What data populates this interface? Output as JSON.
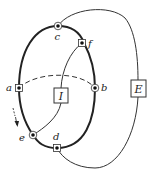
{
  "diagram": {
    "vertices": {
      "a": {
        "label": "a",
        "marker": "square"
      },
      "b": {
        "label": "b",
        "marker": "circle"
      },
      "c": {
        "label": "c",
        "marker": "circle"
      },
      "d": {
        "label": "d",
        "marker": "square"
      },
      "e": {
        "label": "e",
        "marker": "circle"
      },
      "f": {
        "label": "f",
        "marker": "square"
      }
    },
    "boxes": {
      "inner": {
        "label": "I"
      },
      "outer": {
        "label": "E"
      }
    },
    "edges": [
      {
        "from": "a",
        "to": "c",
        "style": "thick"
      },
      {
        "from": "c",
        "to": "f",
        "style": "thick"
      },
      {
        "from": "f",
        "to": "b",
        "style": "thick"
      },
      {
        "from": "b",
        "to": "d",
        "style": "thick"
      },
      {
        "from": "d",
        "to": "e",
        "style": "thick"
      },
      {
        "from": "e",
        "to": "a",
        "style": "thick"
      },
      {
        "from": "a",
        "to": "b",
        "style": "dashed"
      },
      {
        "from": "f",
        "to": "I",
        "style": "thin"
      },
      {
        "from": "I",
        "to": "e",
        "style": "thin"
      },
      {
        "from": "c",
        "to": "E",
        "style": "thin"
      },
      {
        "from": "E",
        "to": "d",
        "style": "thin"
      }
    ],
    "direction_arrow": "down-along-left-side",
    "colors": {
      "stroke": "#222222",
      "background": "#ffffff"
    }
  }
}
